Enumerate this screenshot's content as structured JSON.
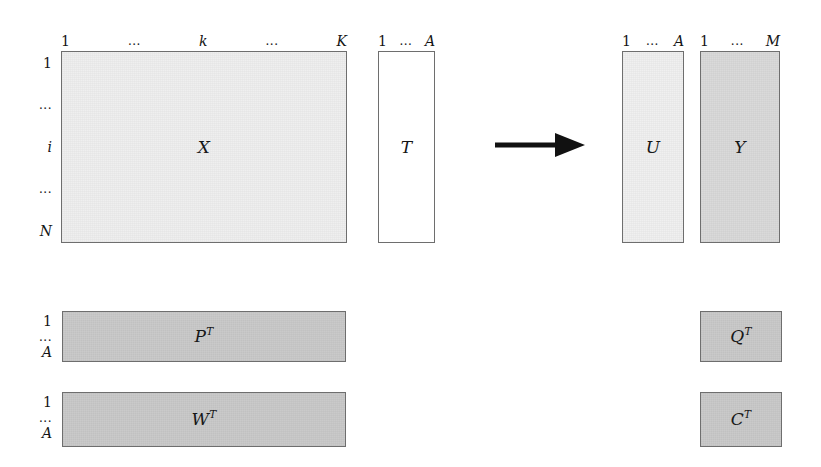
{
  "figure": {
    "type": "matrix-block-diagram",
    "background": "#ffffff",
    "arrow_color": "#111111"
  },
  "colors": {
    "block_border": "#6e6e6e",
    "fill_x": "#efefef",
    "fill_t": "#ffffff",
    "fill_u": "#f0f0f0",
    "fill_y": "#d9d9d9",
    "fill_loadings": "#c9c9c9",
    "text": "#141414"
  },
  "blocks": {
    "x": {
      "symbol": "X",
      "col_labels": [
        "1",
        "...",
        "k",
        "...",
        "K"
      ],
      "row_labels": [
        "1",
        "...",
        "i",
        "...",
        "N"
      ]
    },
    "t": {
      "symbol": "T",
      "col_labels": [
        "1",
        "...",
        "A"
      ],
      "row_labels": []
    },
    "u": {
      "symbol": "U",
      "col_labels": [
        "1",
        "...",
        "A"
      ],
      "row_labels": []
    },
    "y": {
      "symbol": "Y",
      "col_labels": [
        "1",
        "...",
        "M"
      ],
      "row_labels": []
    },
    "pt": {
      "symbol": "P",
      "superscript": "T",
      "row_labels": [
        "1",
        "...",
        "A"
      ]
    },
    "wt": {
      "symbol": "W",
      "superscript": "T",
      "row_labels": [
        "1",
        "...",
        "A"
      ]
    },
    "qt": {
      "symbol": "Q",
      "superscript": "T",
      "row_labels": []
    },
    "ct": {
      "symbol": "C",
      "superscript": "T",
      "row_labels": []
    }
  },
  "arrow": {
    "name": "transformation-arrow",
    "direction": "right"
  }
}
